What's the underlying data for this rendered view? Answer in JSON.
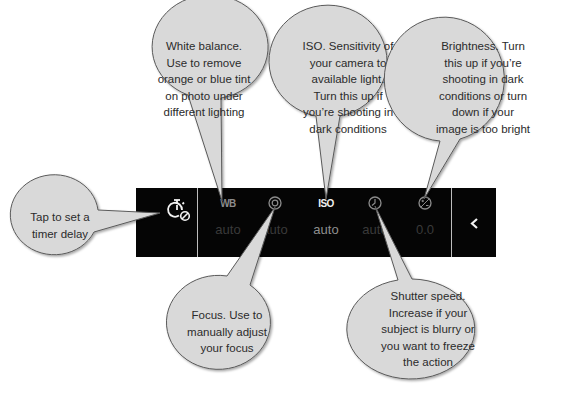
{
  "toolbar": {
    "timer": {
      "icon": "timer-off-icon"
    },
    "controls": [
      {
        "id": "wb",
        "label": "WB",
        "value": "auto",
        "active": false
      },
      {
        "id": "focus",
        "icon": "focus-icon",
        "value": "auto",
        "active": false
      },
      {
        "id": "iso",
        "label": "ISO",
        "value": "auto",
        "active": true
      },
      {
        "id": "shutter",
        "icon": "shutter-speed-icon",
        "value": "auto",
        "active": false
      },
      {
        "id": "brightness",
        "icon": "exposure-icon",
        "value": "0.0",
        "active": false
      }
    ],
    "collapse": {
      "icon": "chevron-left-icon",
      "glyph": "‹"
    }
  },
  "callouts": {
    "timer": "Tap to set a timer delay",
    "timer_lines": [
      "Tap to set a",
      "timer delay"
    ],
    "white_balance_lines": [
      "White balance.",
      "Use to remove",
      "orange or blue tint",
      "on photo under",
      "different lighting"
    ],
    "iso_lines": [
      "ISO. Sensitivity of",
      "your camera to",
      "available light.",
      "Turn this up if",
      "you’re shooting in",
      "dark conditions"
    ],
    "brightness_lines": [
      "Brightness. Turn",
      "this up if you’re",
      "shooting in dark",
      "conditions or turn",
      "down if your",
      "image is too bright"
    ],
    "focus_lines": [
      "Focus. Use to",
      "manually adjust",
      "your focus"
    ],
    "shutter_lines": [
      "Shutter speed.",
      "Increase if your",
      "subject is blurry or",
      "you want to freeze",
      "the action"
    ]
  },
  "colors": {
    "bar": "#050505",
    "bubble_fill": "#d9d9d9",
    "bubble_stroke": "#5a5a5a",
    "text": "#2b2b2b"
  }
}
